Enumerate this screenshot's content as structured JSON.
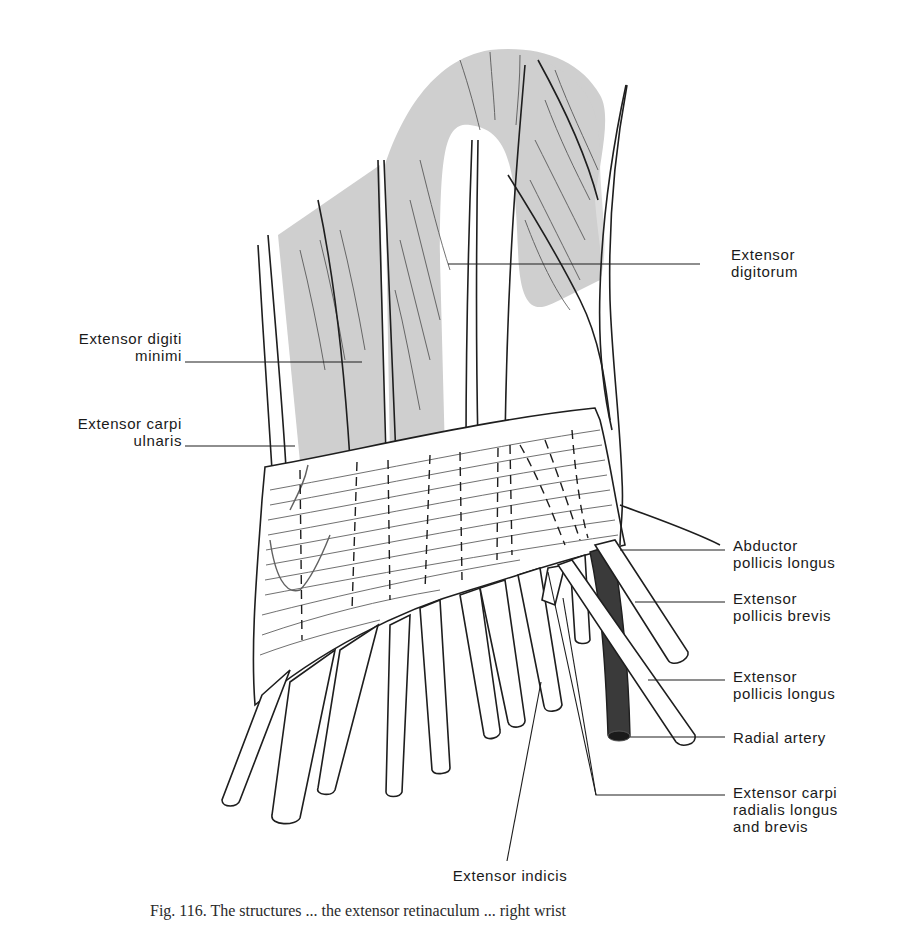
{
  "figure": {
    "colors": {
      "muscle_fill": "#cfcfcf",
      "line": "#1e1e1e",
      "artery_fill": "#3a3a3a",
      "background": "#ffffff"
    }
  },
  "labels": {
    "extensor_digitorum": [
      "Extensor",
      "digitorum"
    ],
    "extensor_digiti_minimi": [
      "Extensor digiti",
      "minimi"
    ],
    "extensor_carpi_ulnaris": [
      "Extensor carpi",
      "ulnaris"
    ],
    "abductor_pollicis_longus": [
      "Abductor",
      "pollicis longus"
    ],
    "extensor_pollicis_brevis": [
      "Extensor",
      "pollicis brevis"
    ],
    "extensor_pollicis_longus": [
      "Extensor",
      "pollicis longus"
    ],
    "radial_artery": [
      "Radial artery"
    ],
    "extensor_carpi_radialis": [
      "Extensor carpi",
      "radialis longus",
      "and brevis"
    ],
    "extensor_indicis": [
      "Extensor indicis"
    ]
  },
  "caption": {
    "text": "Fig. 116. The structures ... the extensor retinaculum ... right wrist"
  }
}
